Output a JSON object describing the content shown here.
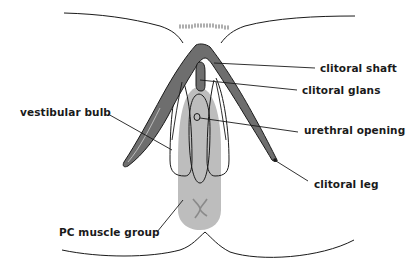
{
  "diagram": {
    "type": "anatomical-illustration",
    "colors": {
      "outline": "#1a1a1a",
      "clitoris_fill": "#6e6e6e",
      "muscle_fill": "#bdbdbd",
      "muscle_mark": "#8a8a8a",
      "hair": "#9a9a9a",
      "background": "#ffffff"
    },
    "labels": [
      {
        "id": "clitoral-shaft",
        "text": "clitoral shaft"
      },
      {
        "id": "clitoral-glans",
        "text": "clitoral glans"
      },
      {
        "id": "vestibular-bulb",
        "text": "vestibular bulb"
      },
      {
        "id": "urethral-opening",
        "text": "urethral opening"
      },
      {
        "id": "clitoral-leg",
        "text": "clitoral leg"
      },
      {
        "id": "pc-muscle-group",
        "text": "PC muscle group"
      }
    ]
  }
}
